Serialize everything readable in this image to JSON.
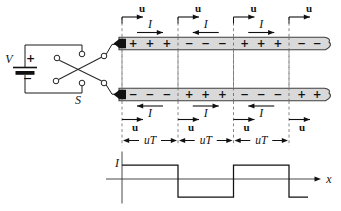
{
  "source": {
    "voltage_label": "V",
    "plus_sign": "+",
    "minus_sign": "−",
    "switch_label": "S"
  },
  "transmission_line": {
    "boundaries_x": [
      122,
      178,
      233.5,
      289
    ],
    "line_end_x": 326,
    "velocity_label": "u",
    "current_label": "I",
    "segment_length_label": "uT",
    "sections": [
      {
        "top_charges": [
          "+",
          "+",
          "+"
        ],
        "bottom_charges": [
          "−",
          "−",
          "−"
        ],
        "top_current": "right",
        "bottom_current": "left"
      },
      {
        "top_charges": [
          "−",
          "−",
          "−"
        ],
        "bottom_charges": [
          "+",
          "+",
          "+"
        ],
        "top_current": "left",
        "bottom_current": "right"
      },
      {
        "top_charges": [
          "+",
          "+",
          "+"
        ],
        "bottom_charges": [
          "−",
          "−",
          "−"
        ],
        "top_current": "right",
        "bottom_current": "left"
      },
      {
        "top_charges": [
          "−",
          "−"
        ],
        "bottom_charges": [
          "+",
          "+"
        ],
        "top_current": null,
        "bottom_current": null
      }
    ]
  },
  "graph": {
    "y_axis_label": "I",
    "x_axis_label": "x",
    "waveform": {
      "type": "square",
      "segments": [
        {
          "from_x": 122,
          "to_x": 178,
          "level": "high"
        },
        {
          "from_x": 178,
          "to_x": 233.5,
          "level": "low"
        },
        {
          "from_x": 233.5,
          "to_x": 289,
          "level": "high"
        },
        {
          "from_x": 289,
          "to_x": 308,
          "level": "low"
        }
      ]
    }
  }
}
